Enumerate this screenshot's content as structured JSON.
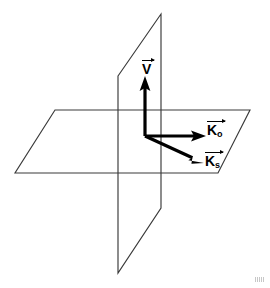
{
  "figure": {
    "background_color": "#ffffff",
    "edge_color": "#3a3a3a",
    "vector_color": "#000000",
    "width": 270,
    "height": 288,
    "planes": [
      {
        "name": "horizontal-plane",
        "description": "Parallelogram representing the horizontal scattering plane seen in perspective",
        "points": "55,110 250,110 218,173 15,173"
      },
      {
        "name": "vertical-plane",
        "description": "Parallelogram representing the vertical plane seen edge-on in perspective",
        "points": "118,76 161,14 161,208 118,273"
      }
    ],
    "origin": {
      "x": 145,
      "y": 136
    },
    "vectors": [
      {
        "name": "velocity-vector",
        "label_base": "V",
        "label_subscript": "",
        "overbar_arrow": true,
        "from": {
          "x": 145,
          "y": 136
        },
        "to": {
          "x": 145,
          "y": 78
        },
        "direction": "up",
        "label_position": {
          "x": 142,
          "y": 60
        }
      },
      {
        "name": "incident-wave-vector",
        "label_base": "K",
        "label_subscript": "o",
        "overbar_arrow": true,
        "from": {
          "x": 145,
          "y": 136
        },
        "to": {
          "x": 205,
          "y": 136
        },
        "direction": "right",
        "label_position": {
          "x": 207,
          "y": 121
        }
      },
      {
        "name": "scattered-wave-vector",
        "label_base": "K",
        "label_subscript": "s",
        "overbar_arrow": true,
        "from": {
          "x": 145,
          "y": 136
        },
        "to": {
          "x": 203,
          "y": 163
        },
        "direction": "down-right",
        "label_position": {
          "x": 205,
          "y": 152
        }
      }
    ]
  }
}
